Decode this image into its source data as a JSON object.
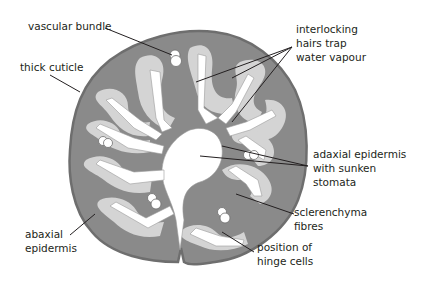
{
  "diagram": {
    "colors": {
      "mesophyll": "#8a8a8a",
      "outline": "#6e6e6e",
      "sclerenchyma": "#d4d4d4",
      "hairs": "#ffffff",
      "label_line": "#231f20",
      "text": "#231f20"
    },
    "labels": [
      {
        "id": "vascular-bundle",
        "text": "vascular bundle"
      },
      {
        "id": "thick-cuticle",
        "text": "thick cuticle"
      },
      {
        "id": "interlocking-hairs",
        "text": "interlocking\nhairs trap\nwater vapour"
      },
      {
        "id": "adaxial-epidermis",
        "text": "adaxial epidermis\nwith sunken\nstomata"
      },
      {
        "id": "sclerenchyma",
        "text": "sclerenchyma\nfibres"
      },
      {
        "id": "abaxial-epidermis",
        "text": "abaxial\nepidermis"
      },
      {
        "id": "hinge-cells",
        "text": "position of\nhinge cells"
      }
    ]
  }
}
